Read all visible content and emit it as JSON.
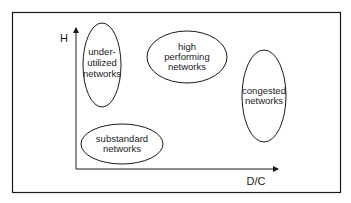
{
  "diagram": {
    "axes": {
      "y_label": "H",
      "x_label": "D/C"
    },
    "regions": [
      {
        "id": "under-utilized",
        "lines": [
          "under-",
          "utilized",
          "networks"
        ]
      },
      {
        "id": "high-performing",
        "lines": [
          "high",
          "performing",
          "networks"
        ]
      },
      {
        "id": "congested",
        "lines": [
          "congested",
          "networks"
        ]
      },
      {
        "id": "substandard",
        "lines": [
          "substandard",
          "networks"
        ]
      }
    ],
    "colors": {
      "stroke": "#1a1a1a",
      "background": "#ffffff"
    }
  }
}
